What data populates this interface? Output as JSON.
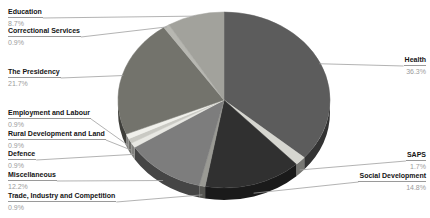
{
  "chart_data": {
    "type": "pie",
    "style": "3d-pie",
    "title": "",
    "legend_position": "around-labels",
    "start_angle_deg": 0,
    "direction": "clockwise",
    "slices": [
      {
        "label": "Health",
        "value": 36.3,
        "display": "36.3%",
        "color": "#5c5c5c"
      },
      {
        "label": "SAPS",
        "value": 1.7,
        "display": "1.7%",
        "color": "#d6d6d0"
      },
      {
        "label": "Social Development",
        "value": 14.8,
        "display": "14.8%",
        "color": "#303030"
      },
      {
        "label": "Trade, Industry and Competition",
        "value": 0.9,
        "display": "0.9%",
        "color": "#9a9a94"
      },
      {
        "label": "Miscellaneous",
        "value": 12.2,
        "display": "12.2%",
        "color": "#7d7d7d"
      },
      {
        "label": "Defence",
        "value": 0.9,
        "display": "0.9%",
        "color": "#e8e8e3"
      },
      {
        "label": "Rural Development and Land",
        "value": 0.9,
        "display": "0.9%",
        "color": "#c9c9c3"
      },
      {
        "label": "Employment and Labour",
        "value": 0.9,
        "display": "0.9%",
        "color": "#f0f0eb"
      },
      {
        "label": "The Presidency",
        "value": 21.7,
        "display": "21.7%",
        "color": "#73736c"
      },
      {
        "label": "Correctional Services",
        "value": 0.9,
        "display": "0.9%",
        "color": "#b7b7b1"
      },
      {
        "label": "Education",
        "value": 8.7,
        "display": "8.7%",
        "color": "#a2a29c"
      }
    ],
    "leader_line_color": "#a0a0a0",
    "label_text_color": "#141414",
    "percent_text_color": "#9b9b9b",
    "background_color": "#ffffff"
  }
}
